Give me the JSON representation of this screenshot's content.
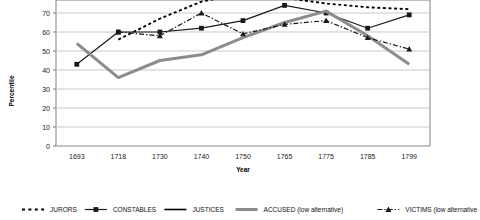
{
  "chart_data": {
    "type": "line",
    "title": "",
    "xlabel": "Year",
    "ylabel": "Percentile",
    "categories": [
      "1693",
      "1718",
      "1730",
      "1740",
      "1750",
      "1765",
      "1775",
      "1785",
      "1799"
    ],
    "ylim": [
      0,
      76
    ],
    "yticks": [
      0,
      10,
      20,
      30,
      40,
      50,
      60,
      70
    ],
    "grid": true,
    "legend_position": "bottom",
    "note_top_cropped": "plot area is cropped at the top; values above ~76 are not visible",
    "series": [
      {
        "name": "JURORS",
        "style": "dotted",
        "color": "#000000",
        "marker": "none",
        "values": [
          null,
          56,
          67,
          76,
          80,
          78,
          75,
          73,
          72
        ]
      },
      {
        "name": "CONSTABLES",
        "style": "solid",
        "color": "#1a1a1a",
        "marker": "square",
        "values": [
          43,
          60,
          60,
          62,
          66,
          74,
          70,
          62,
          69
        ]
      },
      {
        "name": "JUSTICES",
        "style": "solid",
        "color": "#000000",
        "marker": "none",
        "values": [
          null,
          null,
          null,
          null,
          null,
          null,
          null,
          null,
          null
        ]
      },
      {
        "name": "ACCUSED (low alternative)",
        "style": "solid-thick",
        "color": "#8c8c8c",
        "marker": "none",
        "values": [
          54,
          36,
          45,
          48,
          57,
          65,
          71,
          58,
          43
        ]
      },
      {
        "name": "VICTIMS (low alternative)",
        "style": "dash-dot",
        "color": "#1a1a1a",
        "marker": "triangle",
        "values": [
          null,
          60,
          58,
          70,
          59,
          64,
          66,
          57,
          51
        ]
      }
    ]
  },
  "legend": {
    "items": [
      {
        "label": "JURORS",
        "sample": "dotted"
      },
      {
        "label": "CONSTABLES",
        "sample": "line-square"
      },
      {
        "label": "JUSTICES",
        "sample": "solid"
      },
      {
        "label": "ACCUSED (low alternative)",
        "sample": "solid-thick-gray"
      },
      {
        "label": "VICTIMS (low alternative",
        "sample": "dash-dot-triangle"
      }
    ]
  },
  "colors": {
    "grid": "#c8c8c8",
    "axis": "#808080",
    "accused": "#8c8c8c",
    "ink": "#1a1a1a"
  }
}
